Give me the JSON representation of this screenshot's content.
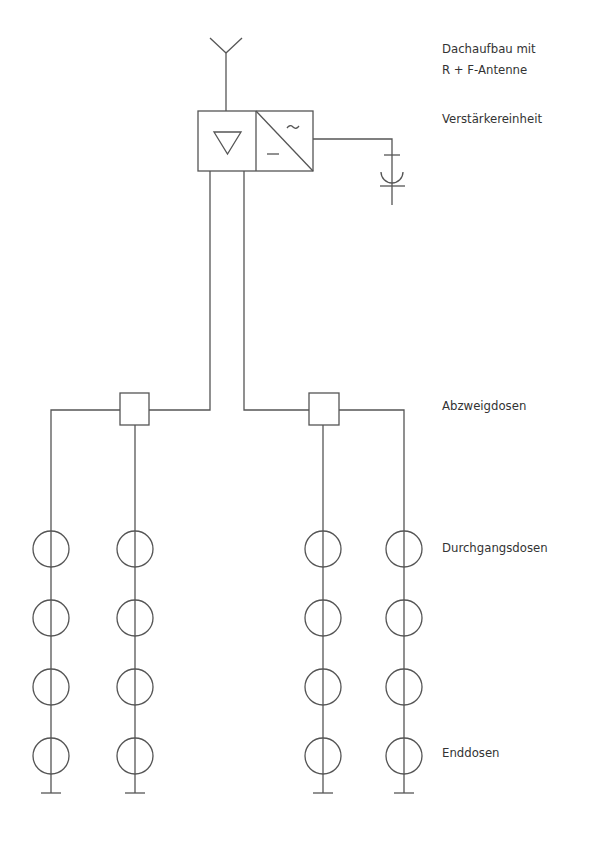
{
  "diagram": {
    "title_area": "Antenna distribution system (Gemeinschaftsantennenanlage)",
    "labels": {
      "roof_line1": "Dachaufbau mit",
      "roof_line2": "R + F-Antenne",
      "amplifier": "Verstärkereinheit",
      "branch": "Abzweigdosen",
      "through": "Durchgangsdosen",
      "end": "Enddosen"
    },
    "symbols": {
      "amplifier_sign": "▽",
      "converter_ac": "~",
      "converter_dc": "–"
    },
    "structure": {
      "branch_boxes": 2,
      "lines_per_branch": 2,
      "outlets_per_line": 4,
      "through_outlets_per_line": 3,
      "end_outlets_per_line": 1
    },
    "colors": {
      "line": "#555555",
      "text": "#333333",
      "background": "#ffffff"
    }
  }
}
